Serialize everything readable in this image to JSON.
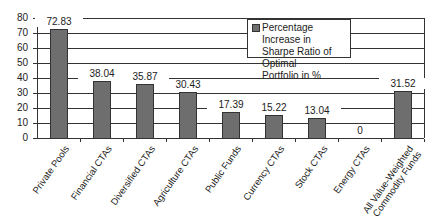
{
  "chart_data": {
    "type": "bar",
    "title": "",
    "xlabel": "",
    "ylabel": "",
    "ylim": [
      0,
      80
    ],
    "yticks": [
      0,
      10,
      20,
      30,
      40,
      50,
      60,
      70,
      80
    ],
    "grid": true,
    "legend": {
      "position": "upper-center-right",
      "entries": [
        "Percentage Increase in Sharpe Ratio of Optimal Portfolio in %"
      ]
    },
    "categories": [
      "Private Pools",
      "Financial CTAs",
      "Diversified CTAs",
      "Agriculture CTAs",
      "Public Funds",
      "Currency CTAs",
      "Stock CTAs",
      "Energy CTAs",
      "All Value-Weighted Commodity Funds"
    ],
    "series": [
      {
        "name": "Percentage Increase in Sharpe Ratio of Optimal Portfolio in %",
        "values": [
          72.83,
          38.04,
          35.87,
          30.43,
          17.39,
          15.22,
          13.04,
          0,
          31.52
        ],
        "labels": [
          "72.83",
          "38.04",
          "35.87",
          "30.43",
          "17.39",
          "15.22",
          "13.04",
          "0",
          "31.52"
        ]
      }
    ]
  },
  "legend": {
    "line1": "Percentage Increase in",
    "line2": "Sharpe Ratio of Optimal",
    "line3": "Portfolio in %"
  },
  "colors": {
    "bar": "#6e6e6e",
    "grid": "#333333"
  }
}
